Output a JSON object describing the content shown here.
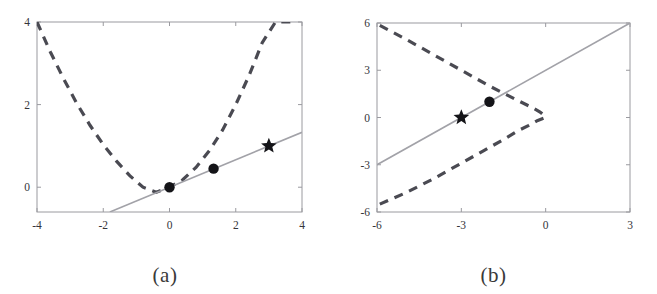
{
  "figure": {
    "width": 657,
    "height": 294,
    "background": "#ffffff",
    "panel_count": 2
  },
  "colors": {
    "dashed_curve": "#4a4a52",
    "solid_line": "#a2a2a8",
    "marker": "#141418",
    "axis": "#9a9a9f",
    "text": "#35353a"
  },
  "panels": [
    {
      "id": "a",
      "caption": "(a)",
      "box": {
        "left": 37,
        "top": 22,
        "right": 302,
        "bottom": 212
      }
    },
    {
      "id": "b",
      "caption": "(b)",
      "box": {
        "left": 47,
        "top": 23,
        "right": 300,
        "bottom": 212
      }
    }
  ],
  "chart_data": [
    {
      "type": "line",
      "panel": "a",
      "title": "",
      "caption": "(a)",
      "xlabel": "",
      "ylabel": "",
      "xlim": [
        -4,
        4
      ],
      "ylim": [
        -0.6,
        4
      ],
      "xticks": [
        -4,
        -2,
        0,
        2,
        4
      ],
      "xtick_labels": [
        "-4",
        "-2",
        "0",
        "2",
        "4"
      ],
      "yticks": [
        0,
        2,
        4
      ],
      "ytick_labels": [
        "0",
        "2",
        "4"
      ],
      "grid": false,
      "legend": "none",
      "series": [
        {
          "name": "objective-curve",
          "style": "dashed",
          "color": "#4a4a52",
          "description": "upward parabola, vertex near (-0.4, -0.1)",
          "x": [
            -4.0,
            -3.6,
            -3.2,
            -2.8,
            -2.4,
            -2.0,
            -1.6,
            -1.2,
            -0.8,
            -0.4,
            0.0,
            0.4,
            0.8,
            1.2,
            1.6,
            2.0,
            2.4,
            2.8,
            3.2,
            3.6,
            3.8
          ],
          "y": [
            4.0,
            3.28,
            2.63,
            2.03,
            1.5,
            1.03,
            0.63,
            0.28,
            0.0,
            -0.12,
            0.0,
            0.18,
            0.48,
            0.88,
            1.38,
            2.0,
            2.7,
            3.5,
            4.0,
            4.0,
            4.0
          ]
        },
        {
          "name": "tangent-line",
          "style": "solid",
          "color": "#a2a2a8",
          "description": "line y = x/3 through origin",
          "x": [
            -1.8,
            4.0
          ],
          "y": [
            -0.6,
            1.33
          ]
        }
      ],
      "markers": [
        {
          "type": "dot",
          "name": "iterate-0",
          "x": 0.0,
          "y": 0.0
        },
        {
          "type": "dot",
          "name": "iterate-1",
          "x": 1.33,
          "y": 0.45
        },
        {
          "type": "star",
          "name": "solution",
          "x": 3.0,
          "y": 1.0
        }
      ]
    },
    {
      "type": "line",
      "panel": "b",
      "title": "",
      "caption": "(b)",
      "xlabel": "",
      "ylabel": "",
      "xlim": [
        -6,
        3
      ],
      "ylim": [
        -6,
        6
      ],
      "xticks": [
        -6,
        -3,
        0,
        3
      ],
      "xtick_labels": [
        "-6",
        "-3",
        "0",
        "3"
      ],
      "yticks": [
        -6,
        -3,
        0,
        3,
        6
      ],
      "ytick_labels": [
        "-6",
        "-3",
        "0",
        "3",
        "6"
      ],
      "grid": false,
      "legend": "none",
      "series": [
        {
          "name": "constraint-curve-upper",
          "style": "dashed",
          "color": "#4a4a52",
          "description": "left-opening parabola upper branch, vertex near (0,0)",
          "x": [
            -5.9,
            -5.0,
            -4.0,
            -3.0,
            -2.0,
            -1.4,
            -0.9,
            -0.5,
            -0.2,
            0.0
          ],
          "y": [
            5.85,
            5.0,
            4.0,
            3.0,
            2.0,
            1.45,
            1.0,
            0.65,
            0.35,
            0.05
          ]
        },
        {
          "name": "constraint-curve-lower",
          "style": "dashed",
          "color": "#4a4a52",
          "description": "left-opening parabola lower branch, vertex near (0,0)",
          "x": [
            -5.9,
            -5.0,
            -4.0,
            -3.0,
            -2.2,
            -1.5,
            -1.0,
            -0.6,
            -0.3,
            0.0
          ],
          "y": [
            -5.5,
            -4.8,
            -3.9,
            -2.9,
            -2.1,
            -1.4,
            -0.85,
            -0.5,
            -0.2,
            0.0
          ]
        },
        {
          "name": "feasible-line",
          "style": "solid",
          "color": "#a2a2a8",
          "description": "line y = x + 3",
          "x": [
            -6.0,
            3.0
          ],
          "y": [
            -3.0,
            6.0
          ]
        }
      ],
      "markers": [
        {
          "type": "star",
          "name": "solution",
          "x": -3.0,
          "y": 0.0
        },
        {
          "type": "dot",
          "name": "iterate",
          "x": -2.0,
          "y": 1.0
        }
      ]
    }
  ]
}
